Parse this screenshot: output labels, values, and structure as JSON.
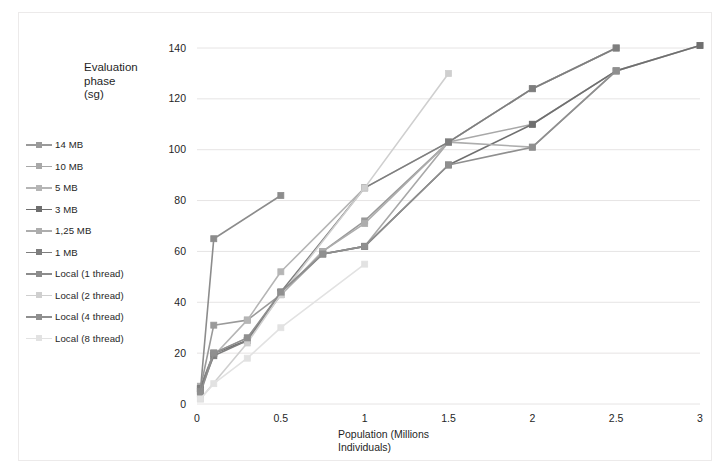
{
  "chart_data": {
    "type": "line",
    "title": "",
    "ylabel": "Evaluation phase (sg)",
    "ylabel_lines": "Evaluation\nphase\n(sg)",
    "xlabel": "Population (Millions Individuals)",
    "xlabel_lines": "Population (Millions\nIndividuals)",
    "xlim": [
      0,
      3
    ],
    "ylim": [
      0,
      140
    ],
    "xticks": [
      "0",
      "0.5",
      "1",
      "1.5",
      "2",
      "2.5",
      "3"
    ],
    "xtick_values": [
      0,
      0.5,
      1,
      1.5,
      2,
      2.5,
      3
    ],
    "yticks": [
      "0",
      "20",
      "40",
      "60",
      "80",
      "100",
      "120",
      "140"
    ],
    "ytick_values": [
      0,
      20,
      40,
      60,
      80,
      100,
      120,
      140
    ],
    "grid": "horizontal",
    "legend_position": "left-outside",
    "marker": "square",
    "series": [
      {
        "name": "14 MB",
        "color": "#9a9a9a",
        "points": [
          [
            0.02,
            6
          ],
          [
            0.1,
            31
          ],
          [
            0.3,
            33
          ],
          [
            0.5,
            43
          ],
          [
            0.75,
            60
          ],
          [
            1.0,
            72
          ],
          [
            1.5,
            103
          ],
          [
            2.0,
            124
          ],
          [
            2.5,
            140
          ]
        ]
      },
      {
        "name": "10 MB",
        "color": "#a8a8a8",
        "points": [
          [
            0.02,
            7
          ],
          [
            0.1,
            20
          ],
          [
            0.3,
            25
          ],
          [
            0.5,
            43
          ],
          [
            0.75,
            59
          ],
          [
            1.0,
            62
          ],
          [
            1.5,
            103
          ],
          [
            2.0,
            110
          ],
          [
            2.5,
            131
          ],
          [
            3.0,
            141
          ]
        ]
      },
      {
        "name": "5 MB",
        "color": "#b5b5b5",
        "points": [
          [
            0.02,
            5
          ],
          [
            0.1,
            19
          ],
          [
            0.3,
            33
          ],
          [
            0.5,
            52
          ],
          [
            1.0,
            85
          ],
          [
            1.5,
            103
          ],
          [
            2.0,
            124
          ],
          [
            2.5,
            140
          ]
        ]
      },
      {
        "name": "3 MB",
        "color": "#6f6f6f",
        "points": [
          [
            0.02,
            6
          ],
          [
            0.1,
            20
          ],
          [
            0.3,
            25
          ],
          [
            0.5,
            44
          ],
          [
            0.75,
            59
          ],
          [
            1.0,
            62
          ],
          [
            1.5,
            94
          ],
          [
            2.0,
            110
          ],
          [
            2.5,
            131
          ],
          [
            3.0,
            141
          ]
        ]
      },
      {
        "name": "1,25 MB",
        "color": "#adadad",
        "points": [
          [
            0.02,
            5
          ],
          [
            0.1,
            20
          ],
          [
            0.3,
            26
          ],
          [
            0.5,
            43
          ],
          [
            0.75,
            60
          ],
          [
            1.0,
            71
          ],
          [
            1.5,
            103
          ],
          [
            2.0,
            101
          ],
          [
            2.5,
            131
          ]
        ]
      },
      {
        "name": "1 MB",
        "color": "#7e7e7e",
        "points": [
          [
            0.02,
            6
          ],
          [
            0.1,
            19
          ],
          [
            0.3,
            25
          ],
          [
            0.5,
            44
          ],
          [
            1.0,
            85
          ],
          [
            1.5,
            103
          ],
          [
            2.0,
            124
          ],
          [
            2.5,
            140
          ]
        ]
      },
      {
        "name": "Local (1 thread)",
        "color": "#8c8c8c",
        "points": [
          [
            0.02,
            5
          ],
          [
            0.1,
            65
          ],
          [
            0.5,
            82
          ]
        ]
      },
      {
        "name": "Local (2 thread)",
        "color": "#cfcfcf",
        "points": [
          [
            0.02,
            2
          ],
          [
            0.3,
            24
          ],
          [
            0.5,
            43
          ],
          [
            1.0,
            85
          ],
          [
            1.5,
            130
          ]
        ]
      },
      {
        "name": "Local (4 thread)",
        "color": "#8f8f8f",
        "points": [
          [
            0.02,
            4
          ],
          [
            0.1,
            20
          ],
          [
            0.3,
            26
          ],
          [
            0.5,
            44
          ],
          [
            0.75,
            59
          ],
          [
            1.0,
            62
          ],
          [
            1.5,
            94
          ],
          [
            2.0,
            101
          ],
          [
            2.5,
            131
          ]
        ]
      },
      {
        "name": "Local (8 thread)",
        "color": "#e2e2e2",
        "points": [
          [
            0.02,
            2
          ],
          [
            0.1,
            8
          ],
          [
            0.3,
            18
          ],
          [
            0.5,
            30
          ],
          [
            1.0,
            55
          ]
        ]
      }
    ]
  },
  "legend": {
    "items": [
      {
        "label": "14 MB"
      },
      {
        "label": "10 MB"
      },
      {
        "label": "5 MB"
      },
      {
        "label": "3 MB"
      },
      {
        "label": "1,25 MB"
      },
      {
        "label": "1 MB"
      },
      {
        "label": "Local (1 thread)"
      },
      {
        "label": "Local (2 thread)"
      },
      {
        "label": "Local (4 thread)"
      },
      {
        "label": "Local (8 thread)"
      }
    ]
  }
}
